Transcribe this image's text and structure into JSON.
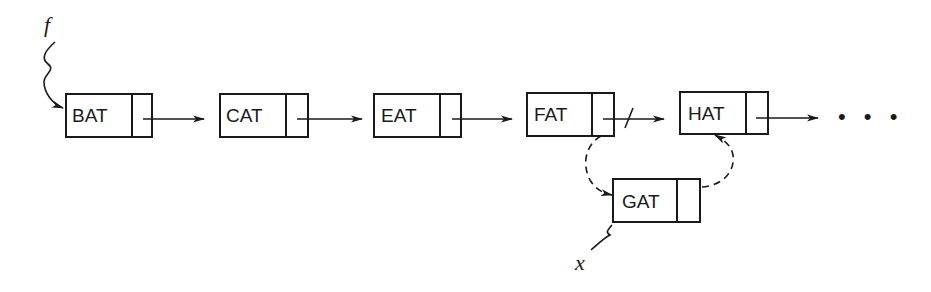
{
  "diagram": {
    "nodes": [
      {
        "id": "bat",
        "label": "BAT"
      },
      {
        "id": "cat",
        "label": "CAT"
      },
      {
        "id": "eat",
        "label": "EAT"
      },
      {
        "id": "fat",
        "label": "FAT"
      },
      {
        "id": "hat",
        "label": "HAT"
      },
      {
        "id": "gat",
        "label": "GAT"
      }
    ],
    "pointers": {
      "head": "f",
      "new_node": "x"
    },
    "ellipsis": "• • •",
    "edges": [
      {
        "from": "BAT",
        "to": "CAT",
        "style": "solid"
      },
      {
        "from": "CAT",
        "to": "EAT",
        "style": "solid"
      },
      {
        "from": "EAT",
        "to": "FAT",
        "style": "solid"
      },
      {
        "from": "FAT",
        "to": "HAT",
        "style": "solid-crossed-out"
      },
      {
        "from": "HAT",
        "to": "...",
        "style": "solid"
      },
      {
        "from": "FAT",
        "to": "GAT",
        "style": "dashed"
      },
      {
        "from": "GAT",
        "to": "HAT",
        "style": "dashed"
      }
    ]
  }
}
